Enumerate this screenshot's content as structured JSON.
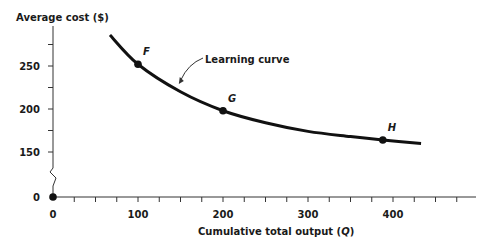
{
  "chart_data": {
    "type": "line",
    "title": "",
    "xlabel": "Cumulative total output (Q)",
    "ylabel": "Average cost ($)",
    "xlim": [
      0,
      500
    ],
    "ylim": [
      0,
      300
    ],
    "y_axis_break": {
      "from": 0,
      "to": 150
    },
    "grid": false,
    "legend": null,
    "x_ticks": [
      0,
      100,
      200,
      300,
      400
    ],
    "x_minor_tick_step": 25,
    "y_ticks": [
      0,
      150,
      200,
      250
    ],
    "y_minor_tick_step": 25,
    "series": [
      {
        "name": "Learning curve",
        "color": "#111111",
        "x": [
          67,
          100,
          150,
          200,
          250,
          300,
          350,
          388,
          433
        ],
        "y": [
          286,
          252,
          220,
          198,
          184,
          174,
          168,
          164,
          160
        ]
      }
    ],
    "points": [
      {
        "label": "F",
        "x": 100,
        "y": 252
      },
      {
        "label": "G",
        "x": 200,
        "y": 198
      },
      {
        "label": "H",
        "x": 388,
        "y": 164
      }
    ],
    "origin_point": {
      "x": 0,
      "y": 0
    },
    "annotations": [
      {
        "text": "Learning curve",
        "arrow_to": {
          "x": 148,
          "y": 229
        }
      }
    ]
  }
}
